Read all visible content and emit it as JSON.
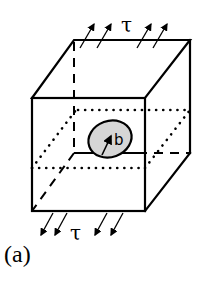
{
  "figure": {
    "panel_label": "(a)",
    "top_stress_label": "τ",
    "bottom_stress_label": "τ",
    "crack_radius_label": "b",
    "colors": {
      "line": "#000000",
      "crack_fill": "#d6d6d6",
      "background": "#ffffff"
    }
  }
}
